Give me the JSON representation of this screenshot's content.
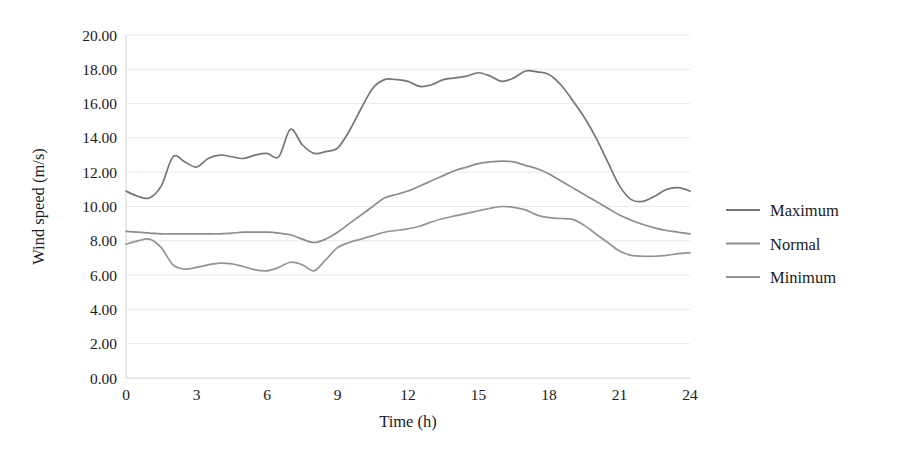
{
  "chart_data": {
    "type": "line",
    "title": "",
    "xlabel": "Time (h)",
    "ylabel": "Wind speed (m/s)",
    "xlim": [
      0,
      24
    ],
    "ylim": [
      0,
      20
    ],
    "xticks": [
      0,
      3,
      6,
      9,
      12,
      15,
      18,
      21,
      24
    ],
    "xtick_labels": [
      "0",
      "3",
      "6",
      "9",
      "12",
      "15",
      "18",
      "21",
      "24"
    ],
    "yticks": [
      0,
      2,
      4,
      6,
      8,
      10,
      12,
      14,
      16,
      18,
      20
    ],
    "ytick_labels": [
      "0.00",
      "2.00",
      "4.00",
      "6.00",
      "8.00",
      "10.00",
      "12.00",
      "14.00",
      "16.00",
      "18.00",
      "20.00"
    ],
    "grid": "horizontal",
    "legend_position": "right",
    "x": [
      0,
      0.5,
      1,
      1.5,
      2,
      2.5,
      3,
      3.5,
      4,
      4.5,
      5,
      5.5,
      6,
      6.5,
      7,
      7.5,
      8,
      8.5,
      9,
      9.5,
      10,
      10.5,
      11,
      11.5,
      12,
      12.5,
      13,
      13.5,
      14,
      14.5,
      15,
      15.5,
      16,
      16.5,
      17,
      17.5,
      18,
      18.5,
      19,
      19.5,
      20,
      20.5,
      21,
      21.5,
      22,
      22.5,
      23,
      23.5,
      24
    ],
    "series": [
      {
        "name": "Maximum",
        "color": "#767676",
        "values": [
          10.9,
          10.6,
          10.5,
          11.2,
          12.9,
          12.6,
          12.3,
          12.8,
          13.0,
          12.9,
          12.8,
          13.0,
          13.1,
          12.9,
          14.5,
          13.6,
          13.1,
          13.2,
          13.4,
          14.4,
          15.7,
          16.9,
          17.4,
          17.4,
          17.3,
          17.0,
          17.1,
          17.4,
          17.5,
          17.6,
          17.8,
          17.6,
          17.3,
          17.5,
          17.9,
          17.85,
          17.7,
          17.1,
          16.2,
          15.2,
          14.0,
          12.6,
          11.2,
          10.4,
          10.3,
          10.6,
          11.0,
          11.1,
          10.9
        ]
      },
      {
        "name": "Normal",
        "color": "#8c8c8c",
        "values": [
          8.55,
          8.5,
          8.45,
          8.4,
          8.4,
          8.4,
          8.4,
          8.4,
          8.4,
          8.45,
          8.5,
          8.5,
          8.5,
          8.45,
          8.35,
          8.1,
          7.9,
          8.1,
          8.5,
          9.0,
          9.5,
          10.0,
          10.5,
          10.7,
          10.9,
          11.2,
          11.5,
          11.8,
          12.1,
          12.3,
          12.5,
          12.6,
          12.65,
          12.6,
          12.4,
          12.2,
          11.9,
          11.5,
          11.1,
          10.7,
          10.3,
          9.9,
          9.5,
          9.2,
          8.95,
          8.75,
          8.6,
          8.5,
          8.4
        ]
      },
      {
        "name": "Minimum",
        "color": "#949494",
        "values": [
          7.8,
          8.0,
          8.1,
          7.6,
          6.6,
          6.35,
          6.45,
          6.6,
          6.7,
          6.65,
          6.5,
          6.3,
          6.25,
          6.45,
          6.75,
          6.6,
          6.25,
          6.9,
          7.6,
          7.9,
          8.1,
          8.3,
          8.5,
          8.6,
          8.7,
          8.85,
          9.1,
          9.3,
          9.45,
          9.6,
          9.75,
          9.9,
          10.0,
          9.95,
          9.8,
          9.5,
          9.35,
          9.3,
          9.25,
          8.9,
          8.4,
          7.9,
          7.4,
          7.15,
          7.1,
          7.1,
          7.15,
          7.25,
          7.3
        ]
      }
    ]
  },
  "legend": {
    "items": [
      {
        "label": "Maximum"
      },
      {
        "label": "Normal"
      },
      {
        "label": "Minimum"
      }
    ]
  }
}
